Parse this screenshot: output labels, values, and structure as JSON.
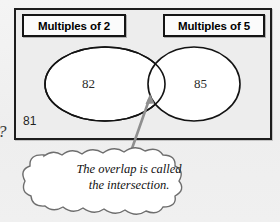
{
  "diagram": {
    "type": "venn-diagram",
    "title_left": "Multiples of 2",
    "title_right": "Multiples of 5",
    "members": {
      "left_only": "82",
      "right_only": "85",
      "outside": "81",
      "intersection": ""
    },
    "margin_text": "?",
    "callout": {
      "line1": "The overlap is called",
      "line2": "the intersection.",
      "shape": "cloud",
      "pointer": "arrow"
    },
    "colors": {
      "outline": "#1d1d1d",
      "rect_fill": "#ededed",
      "ellipse_fill": "#ffffff",
      "cloud_fill": "#ffffff",
      "arrow": "#8a8a8a",
      "text": "#000000"
    }
  }
}
